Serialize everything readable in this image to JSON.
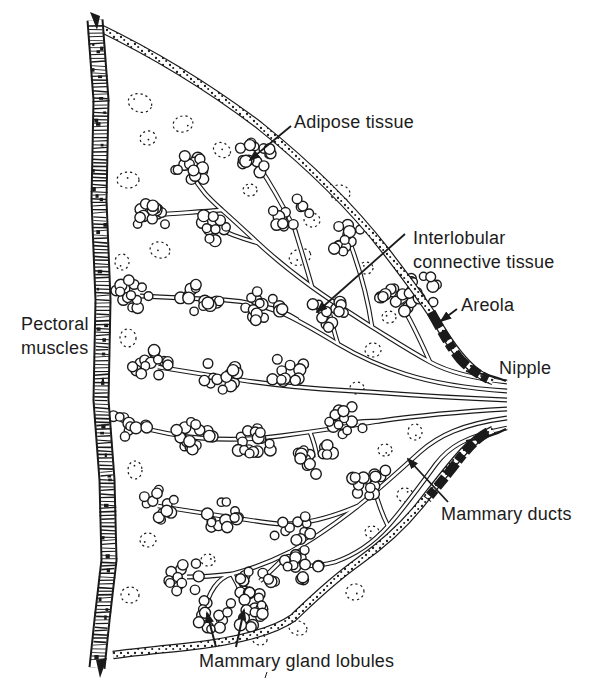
{
  "page": {
    "bg": "#ffffff",
    "ink": "#1a1a1a"
  },
  "labels": {
    "adipose": "Adipose tissue",
    "interlobular": {
      "line1": "Interlobular",
      "line2": "connective tissue"
    },
    "areola": "Areola",
    "nipple": "Nipple",
    "pectoral": {
      "line1": "Pectoral",
      "line2": "muscles"
    },
    "ducts": "Mammary ducts",
    "lobules": "Mammary gland lobules"
  }
}
